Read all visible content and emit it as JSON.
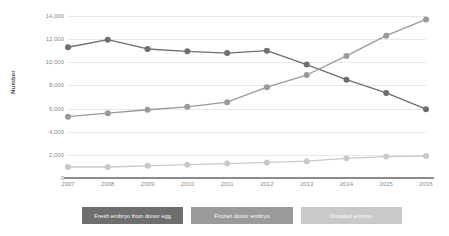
{
  "chart_data": {
    "type": "line",
    "title": "",
    "subtitle": "",
    "xlabel": "",
    "ylabel": "Number",
    "categories": [
      "2007",
      "2008",
      "2009",
      "2010",
      "2011",
      "2012",
      "2013",
      "2014",
      "2015",
      "2016"
    ],
    "ylim": [
      0,
      14000
    ],
    "ytick_values": [
      0,
      2000,
      4000,
      6000,
      8000,
      10000,
      12000,
      14000
    ],
    "ytick_labels": [
      "0",
      "2,000",
      "4,000",
      "6,000",
      "8,000",
      "10,000",
      "12,000",
      "14,000"
    ],
    "grid": true,
    "legend_position": "bottom",
    "series": [
      {
        "name": "Fresh embryo from donor egg",
        "color": "#6e6e6e",
        "values": [
          11300,
          11950,
          11150,
          10950,
          10800,
          11000,
          9800,
          8500,
          7350,
          5950
        ]
      },
      {
        "name": "Frozen donor embryo",
        "color": "#9a9a9a",
        "values": [
          5300,
          5600,
          5900,
          6150,
          6550,
          7850,
          8900,
          10550,
          12300,
          13700
        ]
      },
      {
        "name": "Donated embryo",
        "color": "#c9c9c9",
        "values": [
          950,
          950,
          1050,
          1150,
          1250,
          1350,
          1450,
          1700,
          1850,
          1900
        ]
      }
    ]
  },
  "axis": {
    "y_title": "Number",
    "axis_color": "#8c8c8c",
    "grid_color": "#e8e8e8",
    "tick_text_color": "#8a8a8a"
  },
  "legend": {
    "items": [
      {
        "label": "Fresh embryo from donor egg",
        "color": "#6e6e6e"
      },
      {
        "label": "Frozen donor embryo",
        "color": "#9a9a9a"
      },
      {
        "label": "Donated embryo",
        "color": "#c9c9c9"
      }
    ]
  }
}
